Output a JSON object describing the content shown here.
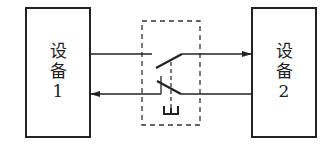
{
  "diagram": {
    "device1": {
      "line1": "设",
      "line2": "备",
      "line3": "1"
    },
    "device2": {
      "line1": "设",
      "line2": "备",
      "line3": "2"
    },
    "switch": {
      "type": "double-pole-switch",
      "linkage": "dashed-mechanical-link",
      "enclosure": "dashed-box"
    },
    "signals": [
      {
        "from": "device1",
        "to": "device2",
        "path": "upper"
      },
      {
        "from": "device2",
        "to": "device1",
        "path": "lower"
      }
    ],
    "colors": {
      "line": "#222222",
      "background": "#ffffff"
    }
  }
}
